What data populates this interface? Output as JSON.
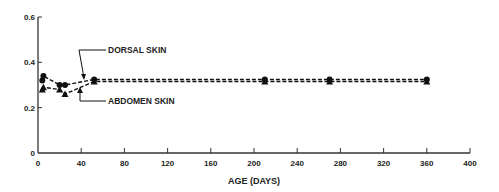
{
  "chart_data": {
    "type": "line",
    "title": "",
    "xlabel": "AGE (DAYS)",
    "ylabel": "",
    "xlim": [
      0,
      400
    ],
    "ylim": [
      0,
      0.6
    ],
    "xticks": [
      0,
      40,
      80,
      120,
      160,
      200,
      240,
      280,
      320,
      360,
      400
    ],
    "xtick_labels": [
      "0",
      "40",
      "80",
      "120",
      "160",
      "200",
      "240",
      "280",
      "320",
      "360",
      "400"
    ],
    "yticks": [
      0,
      0.2,
      0.4,
      0.6
    ],
    "ytick_labels": [
      "0",
      "0.2",
      "0.4",
      "0.6"
    ],
    "grid": false,
    "series": [
      {
        "name": "DORSAL SKIN",
        "marker": "circle",
        "linestyle": "dashed",
        "x": [
          4,
          5,
          20,
          25,
          52,
          210,
          270,
          360
        ],
        "y": [
          0.32,
          0.34,
          0.3,
          0.3,
          0.32,
          0.32,
          0.32,
          0.32
        ]
      },
      {
        "name": "ABDOMEN SKIN",
        "marker": "triangle",
        "linestyle": "dashed",
        "x": [
          4,
          5,
          20,
          25,
          52,
          210,
          270,
          360
        ],
        "y": [
          0.28,
          0.29,
          0.28,
          0.26,
          0.32,
          0.32,
          0.32,
          0.32
        ]
      }
    ],
    "annotations": [
      {
        "text": "DORSAL SKIN",
        "points_to_series": "DORSAL SKIN",
        "label_x": 108,
        "label_y": 0.41
      },
      {
        "text": "ABDOMEN SKIN",
        "points_to_series": "ABDOMEN SKIN",
        "label_x": 108,
        "label_y": 0.23
      }
    ]
  }
}
